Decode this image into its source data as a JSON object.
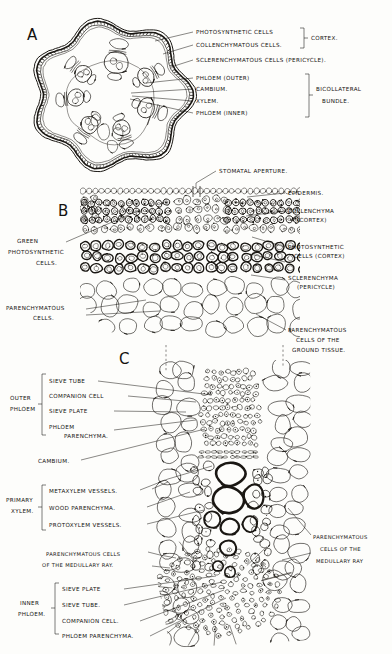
{
  "plate": {
    "title": "Bicollateral stem anatomy plate",
    "panels": [
      {
        "id": "A",
        "letter": "A",
        "caption": "Transverse section of whole stem"
      },
      {
        "id": "B",
        "letter": "B",
        "caption": "Cortex detail"
      },
      {
        "id": "C",
        "letter": "C",
        "caption": "Bicollateral vascular bundle detail"
      }
    ]
  },
  "panelA": {
    "letter": "A",
    "labels": [
      {
        "key": "photosynthetic_cells",
        "text": "PHOTOSYNTHETIC  CELLS"
      },
      {
        "key": "collenchymatous_cells",
        "text": "COLLENCHYMATOUS CELLS."
      },
      {
        "key": "sclerenchymatous_cells",
        "text": "SCLERENCHYMATOUS CELLS (PERICYCLE)."
      },
      {
        "key": "phloem_outer",
        "text": "PHLOEM (OUTER)"
      },
      {
        "key": "cambium",
        "text": "CAMBIUM."
      },
      {
        "key": "xylem",
        "text": "XYLEM."
      },
      {
        "key": "phloem_inner",
        "text": "PHLOEM (INNER)"
      }
    ],
    "brackets": [
      {
        "key": "cortex",
        "text": "CORTEX."
      },
      {
        "key": "bicollateral_bundle_line1",
        "text": "BICOLLATERAL"
      },
      {
        "key": "bicollateral_bundle_line2",
        "text": "BUNDLE."
      }
    ]
  },
  "panelB": {
    "letter": "B",
    "labels": [
      {
        "key": "stomatal_aperture",
        "text": "STOMATAL  APERTURE."
      },
      {
        "key": "epidermis",
        "text": "EPIDERMIS."
      },
      {
        "key": "collenchyma_l1",
        "text": "COLLENCHYMA"
      },
      {
        "key": "collenchyma_l2",
        "text": "(CORTEX)"
      },
      {
        "key": "photosynthetic_l1",
        "text": "PHOTOSYNTHETIC"
      },
      {
        "key": "photosynthetic_l2",
        "text": "CELLS (CORTEX)"
      },
      {
        "key": "sclerenchyma_l1",
        "text": "SCLERENCHYMA"
      },
      {
        "key": "sclerenchyma_l2",
        "text": "(PERICYCLE)"
      },
      {
        "key": "green_photo_l1",
        "text": "GREEN"
      },
      {
        "key": "green_photo_l2",
        "text": "PHOTOSYNTHETIC"
      },
      {
        "key": "green_photo_l3",
        "text": "CELLS."
      },
      {
        "key": "parenchymatous_l1",
        "text": "PARENCHYMATOUS"
      },
      {
        "key": "parenchymatous_l2",
        "text": "CELLS."
      },
      {
        "key": "ground_tissue_l1",
        "text": "PARENCHYMATOUS"
      },
      {
        "key": "ground_tissue_l2",
        "text": "CELLS  OF  THE"
      },
      {
        "key": "ground_tissue_l3",
        "text": "GROUND  TISSUE."
      }
    ]
  },
  "panelC": {
    "letter": "C",
    "groups": [
      {
        "key": "outer_phloem",
        "line1": "OUTER",
        "line2": "PHLOEM"
      },
      {
        "key": "primary_xylem",
        "line1": "PRIMARY",
        "line2": "XYLEM."
      },
      {
        "key": "inner_phloem",
        "line1": "INNER",
        "line2": "PHLOEM."
      }
    ],
    "labels": [
      {
        "key": "sieve_tube_outer",
        "text": "SIEVE TUBE"
      },
      {
        "key": "companion_cell_outer",
        "text": "COMPANION CELL"
      },
      {
        "key": "sieve_plate_outer",
        "text": "SIEVE  PLATE"
      },
      {
        "key": "phloem_parenchyma_outer_l1",
        "text": "PHLOEM"
      },
      {
        "key": "phloem_parenchyma_outer_l2",
        "text": "PARENCHYMA."
      },
      {
        "key": "cambium",
        "text": "CAMBIUM."
      },
      {
        "key": "metaxylem_vessels",
        "text": "METAXYLEM VESSELS."
      },
      {
        "key": "wood_parenchyma",
        "text": "WOOD PARENCHYMA."
      },
      {
        "key": "protoxylem_vessels",
        "text": "PROTOXYLEM VESSELS."
      },
      {
        "key": "medullary_ray_left_l1",
        "text": "PARENCHYMATOUS CELLS"
      },
      {
        "key": "medullary_ray_left_l2",
        "text": "OF THE MEDULLARY RAY."
      },
      {
        "key": "medullary_ray_right_l1",
        "text": "PARENCHYMATOUS"
      },
      {
        "key": "medullary_ray_right_l2",
        "text": "CELLS OF THE"
      },
      {
        "key": "medullary_ray_right_l3",
        "text": "MEDULLARY RAY"
      },
      {
        "key": "sieve_plate_inner",
        "text": "SIEVE PLATE"
      },
      {
        "key": "sieve_tube_inner",
        "text": "SIEVE TUBE."
      },
      {
        "key": "companion_cell_inner",
        "text": "COMPANION CELL."
      },
      {
        "key": "phloem_parenchyma_inner",
        "text": "PHLOEM PARENCHYMA."
      }
    ]
  },
  "colors": {
    "ink": "#14120f",
    "paper": "#fdfdfb",
    "light_ink": "#6d6760"
  }
}
